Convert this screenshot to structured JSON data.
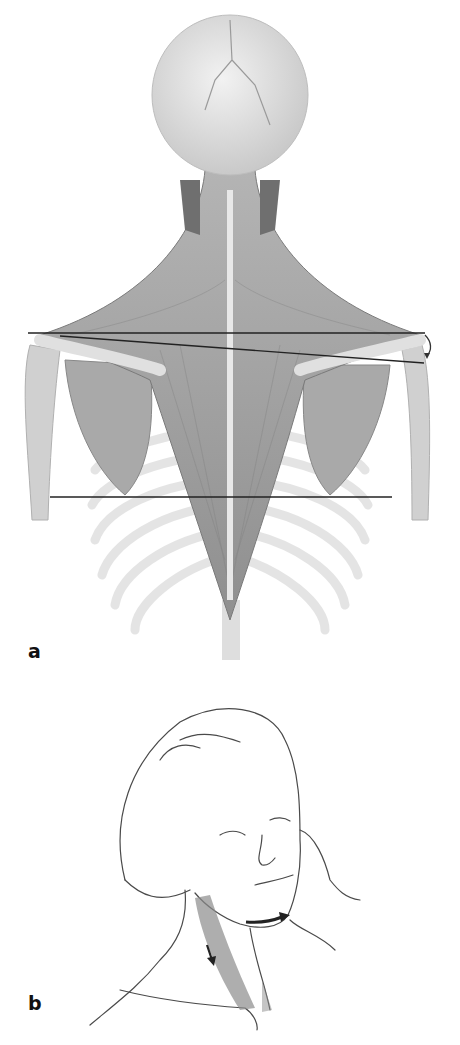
{
  "figure": {
    "panels": [
      {
        "label": "a",
        "subject": "posterior view of skull, neck, trapezius muscle, scapulae, humeri and rib cage",
        "annotations": {
          "reference_lines": [
            {
              "name": "shoulder-horizontal-line",
              "from": [
                28,
                333
              ],
              "to": [
                425,
                333
              ]
            },
            {
              "name": "shoulder-slope-line",
              "from": [
                60,
                336
              ],
              "to": [
                424,
                363
              ]
            },
            {
              "name": "scapula-inferior-angle-line",
              "from": [
                50,
                497
              ],
              "to": [
                392,
                497
              ]
            }
          ],
          "arrow": {
            "name": "curved-arrow-down",
            "position": [
              427,
              345
            ],
            "direction": "down"
          }
        },
        "colors": {
          "muscle": "#9a9a9a",
          "bone": "#dcdcdc",
          "line": "#222222"
        }
      },
      {
        "label": "b",
        "subject": "line drawing of head turned, hand resisting at cheek, sternocleidomastoid shaded",
        "annotations": {
          "arrows": [
            {
              "name": "chin-rotation-arrow",
              "direction": "right"
            },
            {
              "name": "scm-pull-arrow",
              "direction": "down"
            }
          ]
        },
        "colors": {
          "ink": "#444444",
          "shading": "#8c8c8c"
        }
      }
    ]
  }
}
